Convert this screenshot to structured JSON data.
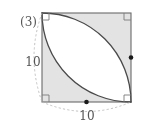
{
  "figure": {
    "problem_number": "(3)",
    "shape": "square-with-two-quarter-circles",
    "labels": {
      "left_side_length": "10",
      "bottom_side_length": "10"
    },
    "colors": {
      "shading": "#e3e3e3",
      "stroke": "#4a4a4a",
      "square_stroke": "#6b6b6b",
      "dashed_guide": "#b5b5b5",
      "text": "#555555",
      "dot": "#1a1a1a",
      "background": "#ffffff"
    },
    "annotations": {
      "right_angle_marks": 4,
      "midpoint_dots": 2,
      "dot_positions": [
        "right-edge-midpoint",
        "bottom-edge-midpoint"
      ]
    },
    "geometry": {
      "square_side_px": 89,
      "square_left_px": 42,
      "square_top_px": 13,
      "arc_radius_px": 89,
      "arc_centers": [
        "top-right-corner",
        "bottom-left-corner"
      ]
    }
  }
}
